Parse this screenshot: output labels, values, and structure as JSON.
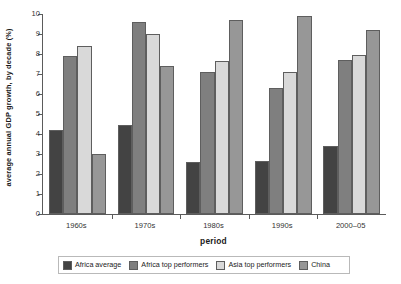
{
  "chart_data": {
    "type": "bar",
    "title": "",
    "xlabel": "period",
    "ylabel": "average annual GDP growth, by decade (%)",
    "categories": [
      "1960s",
      "1970s",
      "1980s",
      "1990s",
      "2000–05"
    ],
    "ylim": [
      0,
      10
    ],
    "yticks": [
      0,
      1,
      2,
      3,
      4,
      5,
      6,
      7,
      8,
      9,
      10
    ],
    "ytick_labels": [
      "0",
      "1",
      "2",
      "3",
      "4",
      "5",
      "6",
      "7",
      "8",
      "9",
      "10"
    ],
    "grid": false,
    "legend_position": "bottom",
    "series": [
      {
        "name": "Africa average",
        "color": "#434343",
        "values": [
          4.2,
          4.45,
          2.6,
          2.65,
          3.4
        ]
      },
      {
        "name": "Africa top performers",
        "color": "#7f7f7f",
        "values": [
          7.9,
          9.6,
          7.1,
          6.3,
          7.7
        ]
      },
      {
        "name": "Asia top performers",
        "color": "#d9d9d9",
        "values": [
          8.4,
          9.0,
          7.65,
          7.1,
          7.95
        ]
      },
      {
        "name": "China",
        "color": "#979797",
        "values": [
          3.0,
          7.4,
          9.7,
          9.9,
          9.2
        ]
      }
    ]
  },
  "axis": {
    "y_title": "average annual GDP growth, by decade (%)",
    "x_title": "period"
  },
  "legend": {
    "items": [
      {
        "label": "Africa average",
        "color": "#434343"
      },
      {
        "label": "Africa top performers",
        "color": "#7f7f7f"
      },
      {
        "label": "Asia top performers",
        "color": "#d9d9d9"
      },
      {
        "label": "China",
        "color": "#979797"
      }
    ]
  }
}
